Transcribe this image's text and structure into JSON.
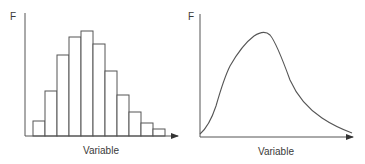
{
  "chart_data": [
    {
      "type": "bar",
      "subtype": "histogram",
      "title": "",
      "ylabel": "F",
      "xlabel": "Variable",
      "categories": [
        "1",
        "2",
        "3",
        "4",
        "5",
        "6",
        "7",
        "8",
        "9",
        "10",
        "11"
      ],
      "values": [
        15,
        45,
        81,
        99,
        104,
        92,
        65,
        41,
        24,
        13,
        7
      ],
      "ylim": [
        0,
        120
      ],
      "grid": false,
      "legend": null,
      "color": "#555555"
    },
    {
      "type": "line",
      "subtype": "smooth distribution curve",
      "title": "",
      "ylabel": "F",
      "xlabel": "Variable",
      "x": [
        0,
        10,
        20,
        30,
        40,
        50,
        60,
        70,
        80,
        90,
        100
      ],
      "values": [
        2,
        28,
        60,
        82,
        94,
        100,
        80,
        50,
        32,
        18,
        4
      ],
      "ylim": [
        0,
        110
      ],
      "grid": false,
      "legend": null,
      "color": "#555555"
    }
  ],
  "left": {
    "y_label": "F",
    "x_label": "Variable"
  },
  "right": {
    "y_label": "F",
    "x_label": "Variable"
  },
  "colors": {
    "stroke": "#555555",
    "text": "#3a3a3a",
    "background": "#ffffff"
  },
  "geometry": {
    "left_bars": [
      {
        "x": 33,
        "top": 121
      },
      {
        "x": 45,
        "top": 91
      },
      {
        "x": 57,
        "top": 55
      },
      {
        "x": 69,
        "top": 37
      },
      {
        "x": 81,
        "top": 31
      },
      {
        "x": 93,
        "top": 44
      },
      {
        "x": 105,
        "top": 71
      },
      {
        "x": 117,
        "top": 95
      },
      {
        "x": 129,
        "top": 112
      },
      {
        "x": 141,
        "top": 123
      },
      {
        "x": 153,
        "top": 129
      }
    ],
    "right_curve": "M200,134 C207,128 212,118 216,106 C220,92 224,78 230,66 C238,52 246,42 254,36 C260,32 266,31 270,35 C276,42 282,58 290,80 C298,98 310,110 322,118 C334,126 344,130 352,133"
  }
}
